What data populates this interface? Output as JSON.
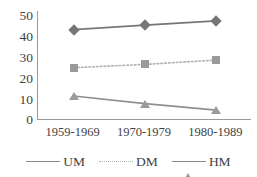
{
  "chart_data": {
    "type": "line",
    "title": "",
    "xlabel": "",
    "ylabel": "",
    "categories": [
      "1959-1969",
      "1970-1979",
      "1980-1989"
    ],
    "yticks": [
      "0",
      "10",
      "20",
      "30",
      "40",
      "50"
    ],
    "ylim": [
      0,
      50
    ],
    "grid": false,
    "legend_position": "bottom",
    "series": [
      {
        "name": "UM",
        "marker": "diamond",
        "line_style": "solid",
        "color": "#767676",
        "values": [
          41.5,
          43.5,
          45.5
        ]
      },
      {
        "name": "DM",
        "marker": "square",
        "line_style": "dotted",
        "color": "#9a9a9a",
        "values": [
          24,
          25.5,
          27.5
        ]
      },
      {
        "name": "HM",
        "marker": "triangle",
        "line_style": "solid",
        "color": "#9a9a9a",
        "values": [
          11,
          7.5,
          4.5
        ]
      }
    ]
  },
  "axis": {
    "y": {
      "t50": "50",
      "t40": "40",
      "t30": "30",
      "t20": "20",
      "t10": "10",
      "t0": "0"
    },
    "x": {
      "c0": "1959-1969",
      "c1": "1970-1979",
      "c2": "1980-1989"
    }
  },
  "legend": {
    "um": "UM",
    "dm": "DM",
    "hm": "HM"
  }
}
